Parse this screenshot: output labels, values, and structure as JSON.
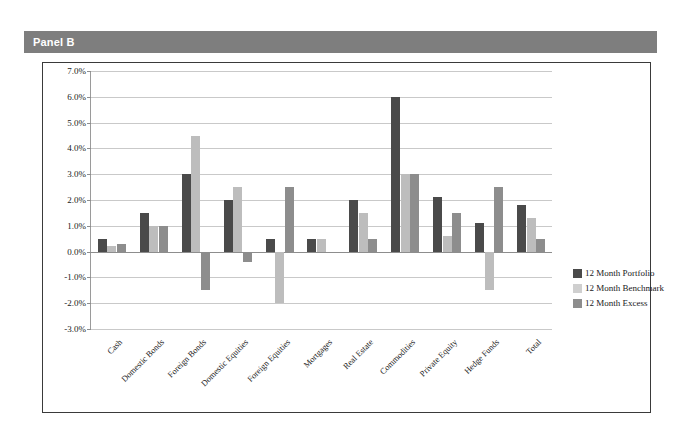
{
  "panel": {
    "label": "Panel B"
  },
  "chart_data": {
    "type": "bar",
    "title": "",
    "xlabel": "",
    "ylabel": "",
    "ylim": [
      -3.0,
      7.0
    ],
    "ytick_step": 1.0,
    "ytick_labels": [
      "7.0%",
      "6.0%",
      "5.0%",
      "4.0%",
      "3.0%",
      "2.0%",
      "1.0%",
      "0.0%",
      "-1.0%",
      "-2.0%",
      "-3.0%"
    ],
    "ytick_values": [
      7.0,
      6.0,
      5.0,
      4.0,
      3.0,
      2.0,
      1.0,
      0.0,
      -1.0,
      -2.0,
      -3.0
    ],
    "grid": true,
    "legend_position": "right",
    "categories": [
      "Cash",
      "Domestic Bonds",
      "Foreign Bonds",
      "Domestic Equities",
      "Foreign Equities",
      "Mortgages",
      "Real Estate",
      "Commodities",
      "Private Equity",
      "Hedge Funds",
      "Total"
    ],
    "series": [
      {
        "name": "12 Month Portfolio",
        "color": "#4a4a4a",
        "values": [
          0.5,
          1.5,
          3.0,
          2.0,
          0.5,
          0.5,
          2.0,
          6.0,
          2.1,
          1.1,
          1.8
        ]
      },
      {
        "name": "12 Month Benchmark",
        "color": "#bdbdbd",
        "values": [
          0.2,
          1.0,
          4.5,
          2.5,
          -2.0,
          0.5,
          1.5,
          3.0,
          0.6,
          -1.5,
          1.3
        ]
      },
      {
        "name": "12 Month Excess",
        "color": "#8d8d8d",
        "values": [
          0.3,
          1.0,
          -1.5,
          -0.4,
          2.5,
          0.0,
          0.5,
          3.0,
          1.5,
          2.5,
          0.5
        ]
      }
    ]
  },
  "legend": {
    "items": [
      {
        "label": "12 Month Portfolio"
      },
      {
        "label": "12 Month Benchmark"
      },
      {
        "label": "12 Month Excess"
      }
    ]
  }
}
